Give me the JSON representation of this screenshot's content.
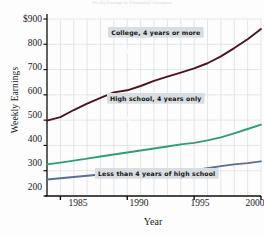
{
  "chart_data": {
    "type": "line",
    "title": "Weekly Earnings by Educational Attainment",
    "xlabel": "Year",
    "ylabel": "Weekly Earnings",
    "xlim": [
      1984,
      2000
    ],
    "ylim": [
      200,
      900
    ],
    "grid": true,
    "legend_position": "inline-callouts",
    "x_ticks": [
      "1985",
      "1990",
      "1995",
      "2000"
    ],
    "x_tick_values": [
      1985,
      1990,
      1995,
      2000
    ],
    "y_ticks": [
      "$900",
      "800",
      "700",
      "600",
      "500",
      "400",
      "300",
      "200"
    ],
    "y_tick_values": [
      900,
      800,
      700,
      600,
      500,
      400,
      300,
      200
    ],
    "x": [
      1984,
      1985,
      1986,
      1987,
      1988,
      1989,
      1990,
      1991,
      1992,
      1993,
      1994,
      1995,
      1996,
      1997,
      1998,
      1999,
      2000
    ],
    "series": [
      {
        "name": "College, 4 years or more",
        "color": "#4a1520",
        "values": [
          498,
          512,
          540,
          565,
          588,
          610,
          618,
          635,
          655,
          672,
          688,
          705,
          725,
          752,
          785,
          820,
          860
        ]
      },
      {
        "name": "High school, 4 years only",
        "color": "#2f9e76",
        "values": [
          325,
          332,
          340,
          348,
          356,
          364,
          372,
          380,
          388,
          396,
          404,
          410,
          420,
          432,
          448,
          465,
          482
        ]
      },
      {
        "name": "Less than 4 years of high school",
        "color": "#5a6e96",
        "values": [
          265,
          270,
          275,
          280,
          285,
          290,
          295,
          300,
          303,
          300,
          300,
          302,
          310,
          318,
          325,
          330,
          337
        ]
      }
    ],
    "annotations": [
      {
        "text": "College, 4 years or more",
        "x_pct": 41.0,
        "y_px": 27
      },
      {
        "text": "High school, 4 years only",
        "x_pct": 40.5,
        "y_px": 93
      },
      {
        "text": "Less than 4 years of high school",
        "x_pct": 36.0,
        "y_px": 168
      }
    ]
  }
}
